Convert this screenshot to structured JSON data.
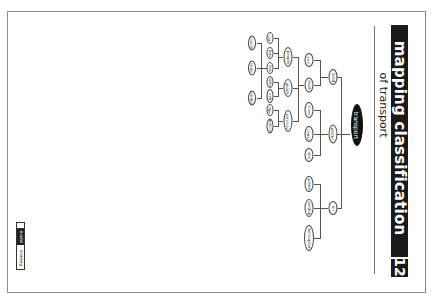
{
  "page": {
    "title": "mapping classification",
    "subtitle": "of transport",
    "page_number": "12",
    "orientation": "rotated 90° clockwise"
  },
  "diagram": {
    "root": "transport",
    "level1": [
      "land",
      "water",
      "air"
    ],
    "land_children": [
      "rail",
      "road"
    ],
    "water_children": [
      "river",
      "canal",
      "sea"
    ],
    "air_children": [
      "plane",
      "airship",
      "helicopter"
    ],
    "road_children": [
      "people",
      "goods",
      "services"
    ],
    "people_children": [
      "car",
      "bus",
      "taxi"
    ],
    "goods_children": [
      "lorry",
      "van"
    ],
    "services_children": [
      "fire",
      "police"
    ],
    "taxi_children": [
      "coach",
      "tram",
      "minibus"
    ]
  },
  "footer": {
    "logo_left": "model",
    "logo_right": "learning"
  },
  "colors": {
    "ink": "#1a1a1a",
    "frame": "#8a8a8a",
    "line": "#555555",
    "paper": "#ffffff"
  }
}
